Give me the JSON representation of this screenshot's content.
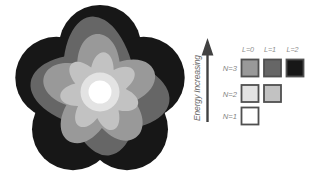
{
  "diagram": {
    "kind": "atomic-orbital-energy-levels"
  },
  "legend": {
    "energy_axis_label": "Energy Increasing",
    "column_headers": [
      "L=0",
      "L=1",
      "L=2"
    ],
    "rows": [
      {
        "label": "N=3",
        "cells": [
          "n3_l0",
          "n3_l1",
          "n3_l2"
        ]
      },
      {
        "label": "N=2",
        "cells": [
          "n2_l0",
          "n2_l1"
        ]
      },
      {
        "label": "N=1",
        "cells": [
          "n1_l0"
        ]
      }
    ]
  },
  "colors": {
    "background": "#ffffff",
    "n1_l0": "#ffffff",
    "n2_l0": "#e3e3e3",
    "n2_l1": "#c2c2c2",
    "n3_l0": "#999999",
    "n3_l1": "#666666",
    "n3_l2": "#171717",
    "square_border": "#4f4f4f",
    "column_label_text": "#8f8f8f",
    "row_label_text": "#858585",
    "energy_label_text": "#6b6b6b",
    "arrow": "#414141"
  }
}
